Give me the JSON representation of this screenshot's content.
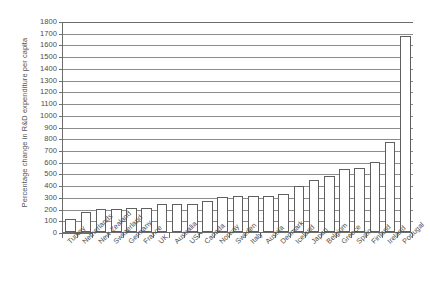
{
  "chart_data": {
    "type": "bar",
    "title": "",
    "xlabel": "",
    "ylabel": "Percentage change in R&D expenditure per capita",
    "ylim": [
      0,
      1800
    ],
    "ytick_step": 100,
    "grid": true,
    "legend": "none",
    "orientation": "vertical",
    "bar_fill": "#ffffff",
    "bar_edge": "#5f5f5f",
    "categories": [
      "Turkey",
      "Netherlands",
      "New Zealand",
      "Switzerland",
      "Germany",
      "France",
      "UK",
      "Australia",
      "USA",
      "Canada",
      "Norway",
      "Sweden",
      "Italy",
      "Austria",
      "Denmark",
      "Iceland",
      "Japan",
      "Belgium",
      "Greece",
      "Spain",
      "Finland",
      "Ireland",
      "Portugal"
    ],
    "values": [
      115,
      175,
      197,
      200,
      202,
      202,
      235,
      240,
      240,
      265,
      295,
      305,
      305,
      308,
      325,
      390,
      445,
      475,
      540,
      545,
      600,
      765,
      1670
    ],
    "ytick_labels": [
      "0",
      "100",
      "200",
      "300",
      "400",
      "500",
      "600",
      "700",
      "800",
      "900",
      "1000",
      "1100",
      "1200",
      "1300",
      "1400",
      "1500",
      "1600",
      "1700",
      "1800"
    ]
  }
}
